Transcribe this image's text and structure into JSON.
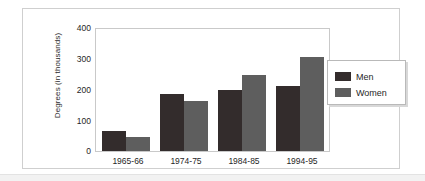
{
  "chart_data": {
    "type": "bar",
    "title": "",
    "subtitle": "",
    "xlabel": "",
    "ylabel": "Degrees (in thousands)",
    "categories": [
      "1965-66",
      "1974-75",
      "1984-85",
      "1994-95"
    ],
    "series": [
      {
        "name": "Men",
        "color": "#332c2c",
        "values": [
          64,
          187,
          200,
          213
        ]
      },
      {
        "name": "Women",
        "color": "#5e5e5e",
        "values": [
          45,
          164,
          248,
          308
        ]
      }
    ],
    "ylim": [
      0,
      400
    ],
    "ytick_labels": [
      "400",
      "300",
      "200",
      "100",
      "0"
    ],
    "ytick_values": [
      400,
      300,
      200,
      100,
      0
    ],
    "grid": false,
    "legend_position": "right",
    "legend_entries": [
      "Men",
      "Women"
    ]
  },
  "legend": {
    "items": [
      {
        "label": "Men",
        "swatch": "men-color-swatch"
      },
      {
        "label": "Women",
        "swatch": "women-color-swatch"
      }
    ]
  },
  "axis": {
    "y_label": "Degrees (in thousands)",
    "y_ticks": [
      "400",
      "300",
      "200",
      "100",
      "0"
    ],
    "x_ticks": [
      "1965-66",
      "1974-75",
      "1984-85",
      "1994-95"
    ]
  },
  "colors": {
    "men": "#332c2c",
    "women": "#5e5e5e",
    "frame": "#cfcfcf",
    "plot_border": "#c9c9c9",
    "text": "#1f1f1f"
  }
}
